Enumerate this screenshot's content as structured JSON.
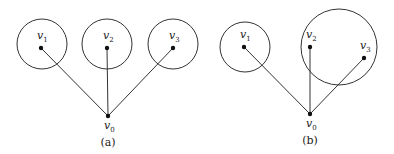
{
  "figures": [
    {
      "caption": "(a)",
      "root": {
        "name": "v",
        "sub": "0",
        "x": 108,
        "y": 116
      },
      "nodes": [
        {
          "name": "v",
          "sub": "1",
          "x": 41,
          "y": 48,
          "circle": {
            "cx": 42,
            "cy": 44,
            "r": 25
          }
        },
        {
          "name": "v",
          "sub": "2",
          "x": 107,
          "y": 48,
          "circle": {
            "cx": 107,
            "cy": 44,
            "r": 25
          }
        },
        {
          "name": "v",
          "sub": "3",
          "x": 173,
          "y": 48,
          "circle": {
            "cx": 173,
            "cy": 44,
            "r": 25
          }
        }
      ]
    },
    {
      "caption": "(b)",
      "root": {
        "name": "v",
        "sub": "0",
        "x": 310,
        "y": 114
      },
      "nodes": [
        {
          "name": "v",
          "sub": "1",
          "x": 244,
          "y": 47,
          "circle": {
            "cx": 245,
            "cy": 47,
            "r": 25
          }
        },
        {
          "name": "v",
          "sub": "2",
          "x": 310,
          "y": 47,
          "circle": null
        },
        {
          "name": "v",
          "sub": "3",
          "x": 364,
          "y": 58,
          "circle": {
            "cx": 339,
            "cy": 47,
            "r": 38
          }
        }
      ]
    }
  ],
  "colors": {
    "stroke": "#333333",
    "node": "#111111"
  }
}
